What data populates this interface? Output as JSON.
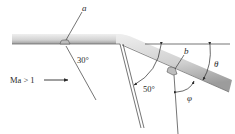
{
  "diagram": {
    "type": "supersonic-expansion-corner",
    "labels": {
      "probe_a": "a",
      "probe_b": "b",
      "angle_a": "30°",
      "angle_fan": "50°",
      "angle_theta": "θ",
      "angle_phi": "φ",
      "flow": "Ma > 1"
    },
    "colors": {
      "wall_light": "#e6e6e6",
      "wall_dark": "#a9a9a9",
      "wall_edge": "#6e6e6e",
      "line": "#3a3a3a",
      "text": "#2a2a2a"
    }
  }
}
